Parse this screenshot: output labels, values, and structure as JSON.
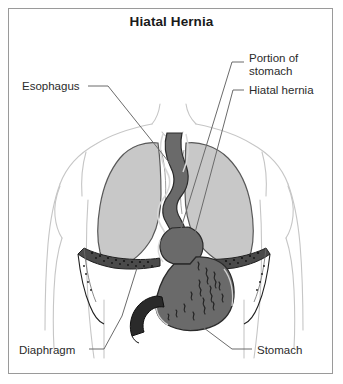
{
  "figure": {
    "title": "Hiatal Hernia",
    "frame_color": "#9a9a9a",
    "background": "#ffffff"
  },
  "labels": {
    "portion_of_stomach": "Portion of\nstomach",
    "hiatal_hernia": "Hiatal hernia",
    "esophagus": "Esophagus",
    "diaphragm": "Diaphragm",
    "stomach": "Stomach"
  },
  "anatomy": {
    "lungs": {
      "name": "lungs",
      "fill": "#c8c8c8",
      "stroke": "#5a5a5a"
    },
    "stomach": {
      "name": "stomach",
      "fill": "#6a6a6a",
      "stroke": "#2a2a2a"
    },
    "rugae": {
      "name": "gastric-rugae",
      "color": "#2b2b2b"
    },
    "diaphragm": {
      "name": "diaphragm",
      "fill": "#4a4a4a",
      "stroke": "#1f1f1f"
    },
    "duodenum": {
      "name": "duodenum",
      "fill": "#2a2a2a"
    },
    "esophagus": {
      "name": "esophagus",
      "fill": "#6a6a6a",
      "stroke": "#2a2a2a"
    },
    "body_outline": {
      "name": "torso-outline",
      "stroke": "#c4c4c4"
    },
    "leader_line_color": "#6b6b6b"
  }
}
